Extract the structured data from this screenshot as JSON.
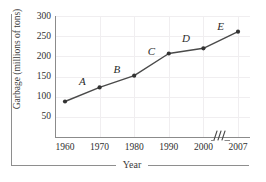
{
  "figure": {
    "y_axis_caption": "Garbage (millions of tons)",
    "x_axis_caption": "Year"
  },
  "chart_data": {
    "type": "line",
    "title": "",
    "xlabel": "Year",
    "ylabel": "Garbage (millions of tons)",
    "x": [
      1960,
      1970,
      1980,
      1990,
      2000,
      2007
    ],
    "values": [
      88,
      123,
      152,
      207,
      220,
      261
    ],
    "x_tick_labels": [
      "1960",
      "1970",
      "1980",
      "1990",
      "2000",
      "2007"
    ],
    "y_tick_labels": [
      "50",
      "100",
      "150",
      "200",
      "250",
      "300"
    ],
    "y_ticks": [
      50,
      100,
      150,
      200,
      250,
      300
    ],
    "ylim": [
      0,
      300
    ],
    "grid": true,
    "legend": "none",
    "axis_break": {
      "between": [
        "2000",
        "2007"
      ],
      "symbol": "zigzag"
    },
    "segment_labels": [
      {
        "label": "A",
        "from": 1960,
        "to": 1970
      },
      {
        "label": "B",
        "from": 1970,
        "to": 1980
      },
      {
        "label": "C",
        "from": 1980,
        "to": 1990
      },
      {
        "label": "D",
        "from": 1990,
        "to": 2000
      },
      {
        "label": "E",
        "from": 2000,
        "to": 2007
      }
    ],
    "colors": {
      "line": "#4a4a4a",
      "marker": "#333333",
      "grid": "#f0eef0",
      "axis": "#8b8b8b",
      "text": "#2f2f2f"
    }
  }
}
